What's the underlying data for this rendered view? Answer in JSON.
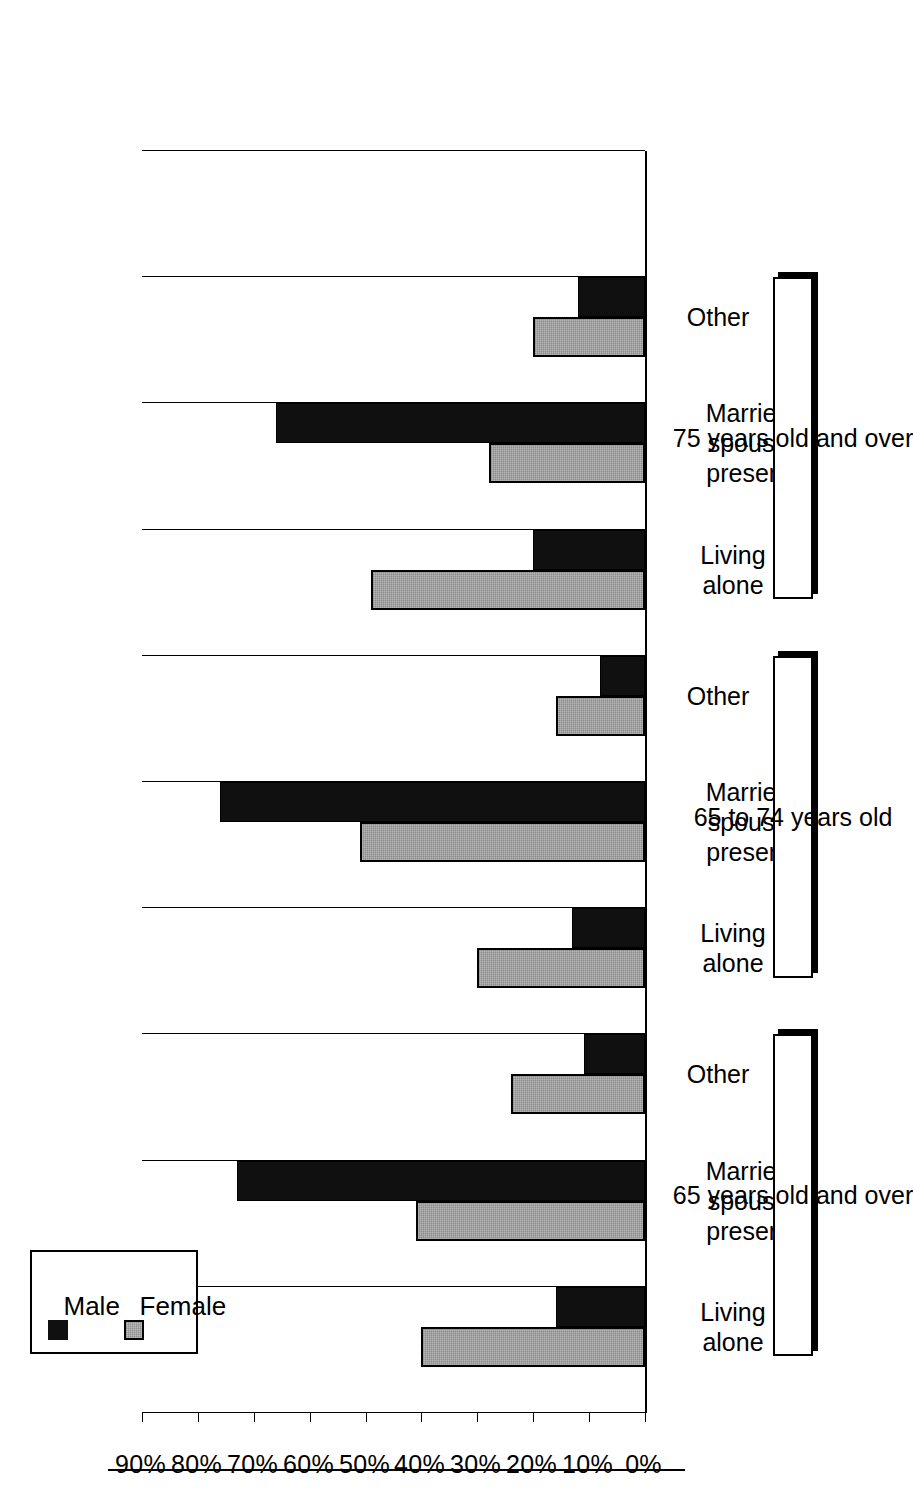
{
  "figure": {
    "orientation": "rotated-90-ccw",
    "background": "#ffffff",
    "axis_color": "#000000"
  },
  "legend": {
    "position": "top-left",
    "entries": [
      {
        "label": "Male",
        "color": "#101010",
        "swatch": "male-swatch"
      },
      {
        "label": "Female",
        "color": "#8c8c8c",
        "swatch": "female-swatch"
      }
    ]
  },
  "groups": [
    {
      "id": "g65over",
      "label": "65 years old and over"
    },
    {
      "id": "g65to74",
      "label": "65 to 74 years old"
    },
    {
      "id": "g75over",
      "label": "75 years old and over"
    }
  ],
  "categories": [
    "Living\nalone",
    "Married\nspouse\npresent",
    "Other"
  ],
  "axis": {
    "value_ticks": [
      "90%",
      "80%",
      "70%",
      "60%",
      "50%",
      "40%",
      "30%",
      "20%",
      "10%",
      "0%"
    ],
    "min": 0,
    "max": 90
  },
  "chart_data": {
    "type": "bar",
    "title": "",
    "subtitle": "",
    "xlabel": "",
    "ylabel": "",
    "orientation": "horizontal",
    "grid": true,
    "legend_position": "top-left",
    "ylim": [
      0,
      90
    ],
    "axis_ticks": [
      0,
      10,
      20,
      30,
      40,
      50,
      60,
      70,
      80,
      90
    ],
    "tick_labels": [
      "0%",
      "10%",
      "20%",
      "30%",
      "40%",
      "50%",
      "60%",
      "70%",
      "80%",
      "90%"
    ],
    "group_labels": [
      "65 years old and over",
      "65 to 74 years old",
      "75 years old and over"
    ],
    "categories": [
      "Living alone",
      "Married spouse present",
      "Other"
    ],
    "series": [
      {
        "name": "Male",
        "color": "#101010",
        "values_by_group": {
          "65 years old and over": [
            16,
            73,
            11
          ],
          "65 to 74 years old": [
            13,
            76,
            8
          ],
          "75 years old and over": [
            20,
            66,
            12
          ]
        }
      },
      {
        "name": "Female",
        "color": "#8c8c8c",
        "values_by_group": {
          "65 years old and over": [
            40,
            41,
            24
          ],
          "65 to 74 years old": [
            30,
            51,
            16
          ],
          "75 years old and over": [
            49,
            28,
            20
          ]
        }
      }
    ]
  }
}
